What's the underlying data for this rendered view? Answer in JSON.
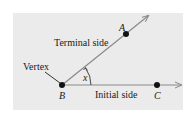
{
  "diagram": {
    "background_color": "#ebebeb",
    "ray_color": "#8a8a8a",
    "point_color": "#111111",
    "labels": {
      "terminal_side": "Terminal side",
      "initial_side": "Initial side",
      "vertex": "Vertex",
      "angle": "x"
    },
    "points": [
      {
        "name": "A",
        "role": "point on terminal side"
      },
      {
        "name": "B",
        "role": "vertex"
      },
      {
        "name": "C",
        "role": "point on initial side"
      }
    ]
  }
}
